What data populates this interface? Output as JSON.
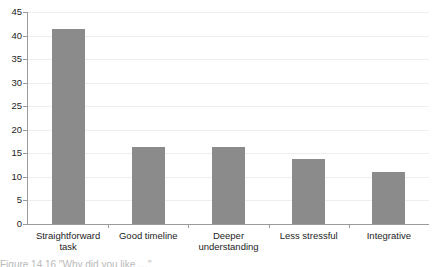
{
  "chart_data": {
    "type": "bar",
    "title": "",
    "subtitle": "",
    "xlabel": "",
    "ylabel": "",
    "categories": [
      "Straightforward task",
      "Good timeline",
      "Deeper understanding",
      "Less stressful",
      "Integrative"
    ],
    "category_lines": [
      [
        "Straightforward",
        "task"
      ],
      [
        "Good timeline"
      ],
      [
        "Deeper",
        "understanding"
      ],
      [
        "Less stressful"
      ],
      [
        "Integrative"
      ]
    ],
    "values": [
      41.5,
      16.4,
      16.4,
      13.8,
      11.0
    ],
    "ylim": [
      0,
      45
    ],
    "ytick_values": [
      0,
      5,
      10,
      15,
      20,
      25,
      30,
      35,
      40,
      45
    ],
    "ytick_labels": [
      "0",
      "5",
      "10",
      "15",
      "20",
      "25",
      "30",
      "35",
      "40",
      "45"
    ],
    "grid": "horizontal",
    "legend": "none",
    "bar_color": "#8b8b8b",
    "grid_color": "#eceef0",
    "axis_color": "#9a9a9a",
    "text_color": "#1d1d1d"
  },
  "caption": {
    "text": "Figure 14.16  \"Why did you like …\"",
    "visible_note": "cropped-partial-line"
  }
}
